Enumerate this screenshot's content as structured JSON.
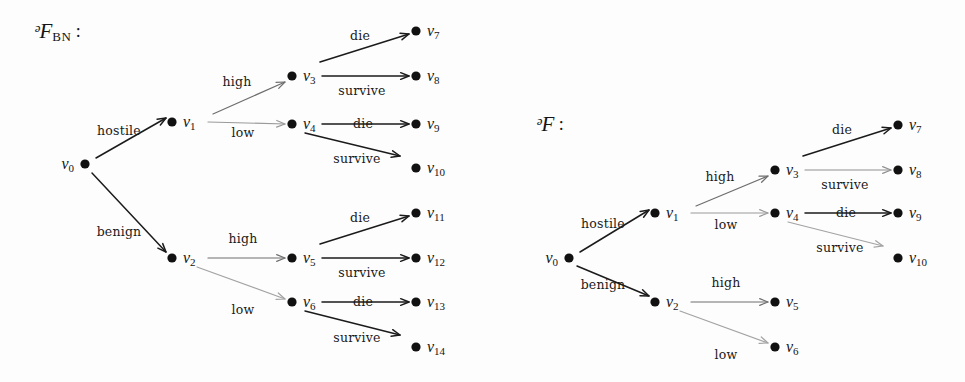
{
  "figure": {
    "background_color": "#fdfdfd",
    "node_color": "#111111",
    "label_color": "#141414",
    "width": 965,
    "height": 382
  },
  "panels": [
    {
      "id": "panel-bn",
      "title_symbol": "ᵊF",
      "title_subscript": "BN",
      "title_colon": " :",
      "title_x": 34,
      "title_y": 33,
      "nodes": [
        {
          "id": "v0",
          "label": "v",
          "sub": "0",
          "x": 85,
          "y": 164,
          "label_side": "left",
          "r": 4.6
        },
        {
          "id": "v1",
          "label": "v",
          "sub": "1",
          "x": 172,
          "y": 122,
          "label_side": "right",
          "r": 4.6
        },
        {
          "id": "v2",
          "label": "v",
          "sub": "2",
          "x": 172,
          "y": 258,
          "label_side": "right",
          "r": 4.6
        },
        {
          "id": "v3",
          "label": "v",
          "sub": "3",
          "x": 292,
          "y": 76,
          "label_side": "right",
          "r": 4.6
        },
        {
          "id": "v4",
          "label": "v",
          "sub": "4",
          "x": 292,
          "y": 124,
          "label_side": "right",
          "r": 4.6
        },
        {
          "id": "v5",
          "label": "v",
          "sub": "5",
          "x": 292,
          "y": 258,
          "label_side": "right",
          "r": 4.6
        },
        {
          "id": "v6",
          "label": "v",
          "sub": "6",
          "x": 292,
          "y": 302,
          "label_side": "right",
          "r": 4.6
        },
        {
          "id": "v7",
          "label": "v",
          "sub": "7",
          "x": 416,
          "y": 31,
          "label_side": "right",
          "r": 4.6
        },
        {
          "id": "v8",
          "label": "v",
          "sub": "8",
          "x": 416,
          "y": 76,
          "label_side": "right",
          "r": 4.6
        },
        {
          "id": "v9",
          "label": "v",
          "sub": "9",
          "x": 416,
          "y": 124,
          "label_side": "right",
          "r": 4.6
        },
        {
          "id": "v10",
          "label": "v",
          "sub": "10",
          "x": 416,
          "y": 168,
          "label_side": "right",
          "r": 4.6
        },
        {
          "id": "v11",
          "label": "v",
          "sub": "11",
          "x": 416,
          "y": 213,
          "label_side": "right",
          "r": 4.6
        },
        {
          "id": "v12",
          "label": "v",
          "sub": "12",
          "x": 416,
          "y": 258,
          "label_side": "right",
          "r": 4.6
        },
        {
          "id": "v13",
          "label": "v",
          "sub": "13",
          "x": 416,
          "y": 302,
          "label_side": "right",
          "r": 4.6
        },
        {
          "id": "v14",
          "label": "v",
          "sub": "14",
          "x": 416,
          "y": 347,
          "label_side": "right",
          "r": 4.6
        }
      ],
      "edges": [
        {
          "id": "e-v0-v1",
          "from": "v0",
          "to": "v1",
          "label": "hostile",
          "lx": 119,
          "ly": 131,
          "x1": 96,
          "y1": 158,
          "x2": 166,
          "y2": 118,
          "color": "#1b1b1b",
          "width": 1.5
        },
        {
          "id": "e-v0-v2",
          "from": "v0",
          "to": "v2",
          "label": "benign",
          "lx": 119,
          "ly": 232,
          "x1": 92,
          "y1": 173,
          "x2": 166,
          "y2": 252,
          "color": "#1b1b1b",
          "width": 1.5
        },
        {
          "id": "e-v1-v3",
          "from": "v1",
          "to": "v3",
          "label": "high",
          "lx": 237,
          "ly": 82,
          "x1": 213,
          "y1": 114,
          "x2": 285,
          "y2": 82,
          "color": "#6e6e6e",
          "width": 1.2
        },
        {
          "id": "e-v1-v4",
          "from": "v1",
          "to": "v4",
          "label": "low",
          "lx": 243,
          "ly": 133,
          "x1": 208,
          "y1": 122,
          "x2": 285,
          "y2": 124,
          "color": "#9a9a9a",
          "width": 1.2
        },
        {
          "id": "e-v2-v5",
          "from": "v2",
          "to": "v5",
          "label": "high",
          "lx": 243,
          "ly": 239,
          "x1": 208,
          "y1": 258,
          "x2": 285,
          "y2": 258,
          "color": "#6e6e6e",
          "width": 1.2
        },
        {
          "id": "e-v2-v6",
          "from": "v2",
          "to": "v6",
          "label": "low",
          "lx": 243,
          "ly": 310,
          "x1": 197,
          "y1": 267,
          "x2": 285,
          "y2": 299,
          "color": "#a3a3a3",
          "width": 1.2
        },
        {
          "id": "e-v3-v7",
          "from": "v3",
          "to": "v7",
          "label": "die",
          "lx": 360,
          "ly": 36,
          "x1": 320,
          "y1": 62,
          "x2": 409,
          "y2": 34,
          "color": "#1b1b1b",
          "width": 1.5
        },
        {
          "id": "e-v3-v8",
          "from": "v3",
          "to": "v8",
          "label": "survive",
          "lx": 362,
          "ly": 91,
          "x1": 322,
          "y1": 76,
          "x2": 409,
          "y2": 76,
          "color": "#1b1b1b",
          "width": 1.5
        },
        {
          "id": "e-v4-v9",
          "from": "v4",
          "to": "v9",
          "label": "die",
          "lx": 363,
          "ly": 124,
          "x1": 322,
          "y1": 124,
          "x2": 409,
          "y2": 124,
          "color": "#1b1b1b",
          "width": 1.5
        },
        {
          "id": "e-v4-v10",
          "from": "v4",
          "to": "v10",
          "label": "survive",
          "lx": 357,
          "ly": 159,
          "x1": 305,
          "y1": 133,
          "x2": 400,
          "y2": 156,
          "color": "#1b1b1b",
          "width": 1.5
        },
        {
          "id": "e-v5-v11",
          "from": "v5",
          "to": "v11",
          "label": "die",
          "lx": 360,
          "ly": 218,
          "x1": 320,
          "y1": 244,
          "x2": 409,
          "y2": 216,
          "color": "#1b1b1b",
          "width": 1.5
        },
        {
          "id": "e-v5-v12",
          "from": "v5",
          "to": "v12",
          "label": "survive",
          "lx": 362,
          "ly": 273,
          "x1": 322,
          "y1": 258,
          "x2": 409,
          "y2": 258,
          "color": "#1b1b1b",
          "width": 1.5
        },
        {
          "id": "e-v6-v13",
          "from": "v6",
          "to": "v13",
          "label": "die",
          "lx": 363,
          "ly": 302,
          "x1": 322,
          "y1": 302,
          "x2": 409,
          "y2": 302,
          "color": "#1b1b1b",
          "width": 1.5
        },
        {
          "id": "e-v6-v14",
          "from": "v6",
          "to": "v14",
          "label": "survive",
          "lx": 357,
          "ly": 338,
          "x1": 305,
          "y1": 311,
          "x2": 400,
          "y2": 335,
          "color": "#1b1b1b",
          "width": 1.5
        }
      ]
    },
    {
      "id": "panel-t",
      "title_symbol": "ᵊF",
      "title_subscript": "",
      "title_colon": " :",
      "title_x": 536,
      "title_y": 126,
      "nodes": [
        {
          "id": "v0",
          "label": "v",
          "sub": "0",
          "x": 569,
          "y": 258,
          "label_side": "left",
          "r": 4.6
        },
        {
          "id": "v1",
          "label": "v",
          "sub": "1",
          "x": 655,
          "y": 213,
          "label_side": "right",
          "r": 4.6
        },
        {
          "id": "v2",
          "label": "v",
          "sub": "2",
          "x": 655,
          "y": 302,
          "label_side": "right",
          "r": 4.6
        },
        {
          "id": "v3",
          "label": "v",
          "sub": "3",
          "x": 775,
          "y": 170,
          "label_side": "right",
          "r": 4.6
        },
        {
          "id": "v4",
          "label": "v",
          "sub": "4",
          "x": 775,
          "y": 213,
          "label_side": "right",
          "r": 4.6
        },
        {
          "id": "v5",
          "label": "v",
          "sub": "5",
          "x": 775,
          "y": 302,
          "label_side": "right",
          "r": 4.6
        },
        {
          "id": "v6",
          "label": "v",
          "sub": "6",
          "x": 775,
          "y": 347,
          "label_side": "right",
          "r": 4.6
        },
        {
          "id": "v7",
          "label": "v",
          "sub": "7",
          "x": 898,
          "y": 125,
          "label_side": "right",
          "r": 4.6
        },
        {
          "id": "v8",
          "label": "v",
          "sub": "8",
          "x": 898,
          "y": 170,
          "label_side": "right",
          "r": 4.6
        },
        {
          "id": "v9",
          "label": "v",
          "sub": "9",
          "x": 898,
          "y": 213,
          "label_side": "right",
          "r": 4.6
        },
        {
          "id": "v10",
          "label": "v",
          "sub": "10",
          "x": 898,
          "y": 258,
          "label_side": "right",
          "r": 4.6
        }
      ],
      "edges": [
        {
          "id": "e-v0-v1",
          "from": "v0",
          "to": "v1",
          "label": "hostile",
          "lx": 603,
          "ly": 224,
          "x1": 580,
          "y1": 252,
          "x2": 649,
          "y2": 210,
          "color": "#1b1b1b",
          "width": 1.5
        },
        {
          "id": "e-v0-v2",
          "from": "v0",
          "to": "v2",
          "label": "benign",
          "lx": 603,
          "ly": 285,
          "x1": 577,
          "y1": 266,
          "x2": 649,
          "y2": 296,
          "color": "#1b1b1b",
          "width": 1.5
        },
        {
          "id": "e-v1-v3",
          "from": "v1",
          "to": "v3",
          "label": "high",
          "lx": 720,
          "ly": 177,
          "x1": 696,
          "y1": 206,
          "x2": 768,
          "y2": 176,
          "color": "#6e6e6e",
          "width": 1.2
        },
        {
          "id": "e-v1-v4",
          "from": "v1",
          "to": "v4",
          "label": "low",
          "lx": 726,
          "ly": 225,
          "x1": 691,
          "y1": 213,
          "x2": 768,
          "y2": 213,
          "color": "#9a9a9a",
          "width": 1.2
        },
        {
          "id": "e-v2-v5",
          "from": "v2",
          "to": "v5",
          "label": "high",
          "lx": 726,
          "ly": 283,
          "x1": 691,
          "y1": 302,
          "x2": 768,
          "y2": 302,
          "color": "#6e6e6e",
          "width": 1.2
        },
        {
          "id": "e-v2-v6",
          "from": "v2",
          "to": "v6",
          "label": "low",
          "lx": 726,
          "ly": 355,
          "x1": 680,
          "y1": 311,
          "x2": 768,
          "y2": 343,
          "color": "#a3a3a3",
          "width": 1.2
        },
        {
          "id": "e-v3-v7",
          "from": "v3",
          "to": "v7",
          "label": "die",
          "lx": 842,
          "ly": 130,
          "x1": 803,
          "y1": 156,
          "x2": 891,
          "y2": 128,
          "color": "#1b1b1b",
          "width": 1.5
        },
        {
          "id": "e-v3-v8",
          "from": "v3",
          "to": "v8",
          "label": "survive",
          "lx": 845,
          "ly": 185,
          "x1": 805,
          "y1": 170,
          "x2": 891,
          "y2": 170,
          "color": "#8f8f8f",
          "width": 1.2
        },
        {
          "id": "e-v4-v9",
          "from": "v4",
          "to": "v9",
          "label": "die",
          "lx": 846,
          "ly": 213,
          "x1": 805,
          "y1": 213,
          "x2": 891,
          "y2": 213,
          "color": "#1b1b1b",
          "width": 1.5
        },
        {
          "id": "e-v4-v10",
          "from": "v4",
          "to": "v10",
          "label": "survive",
          "lx": 840,
          "ly": 248,
          "x1": 788,
          "y1": 222,
          "x2": 883,
          "y2": 246,
          "color": "#a3a3a3",
          "width": 1.2
        }
      ]
    }
  ]
}
